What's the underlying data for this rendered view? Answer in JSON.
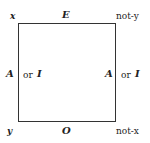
{
  "diagram": {
    "corners": {
      "top_left": "x",
      "top_right": "not-y",
      "bottom_left": "y",
      "bottom_right": "not-x"
    },
    "edges": {
      "top": "E",
      "bottom": "O",
      "left": {
        "a": "A",
        "or": "or",
        "b": "I"
      },
      "right": {
        "a": "A",
        "or": "or",
        "b": "I"
      }
    }
  }
}
